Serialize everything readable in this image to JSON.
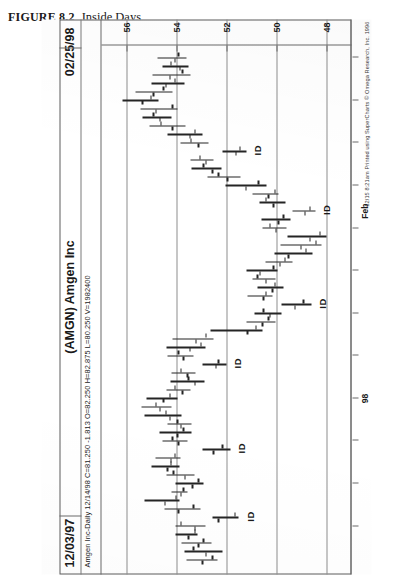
{
  "figure": {
    "number": "FIGURE 8.2",
    "title": "Inside Days"
  },
  "chart_header": {
    "date_left": "12/03/97",
    "symbol_title": "(AMGN) Amgen Inc",
    "date_right": "02/25/98",
    "quote_line": "Amgen Inc-Daily  12/14/98  C=81.250 -1.813  O=82.250  H=82.875  L=80.250  V=1982400"
  },
  "credit": "12/15 8:21am Printed using SuperCharts © Omega Research, Inc. 1996",
  "chart_data": {
    "type": "bar",
    "title": "(AMGN) Amgen Inc",
    "subtitle": "Amgen Inc-Daily  12/14/98  C=81.250 -1.813  O=82.250  H=82.875  L=80.250  V=1982400",
    "xlabel": "",
    "ylabel": "Price",
    "ylim": [
      47.0,
      57.0
    ],
    "yticks": [
      56,
      54,
      52,
      50,
      48
    ],
    "grid": true,
    "legend": null,
    "date_range": [
      "12/03/97",
      "02/25/98"
    ],
    "x_tick_labels": [
      {
        "label": "98",
        "index": 19
      },
      {
        "label": "Feb",
        "index": 41
      }
    ],
    "annotations": [
      {
        "text": "ID",
        "index": 5
      },
      {
        "text": "ID",
        "index": 13
      },
      {
        "text": "ID",
        "index": 23
      },
      {
        "text": "ID",
        "index": 30
      },
      {
        "text": "ID",
        "index": 41
      },
      {
        "text": "ID",
        "index": 48
      }
    ],
    "ohlc": [
      {
        "i": 0,
        "open": 53.0,
        "high": 53.6,
        "low": 52.35,
        "close": 52.6
      },
      {
        "i": 1,
        "open": 52.85,
        "high": 53.7,
        "low": 52.15,
        "close": 53.35
      },
      {
        "i": 2,
        "open": 53.15,
        "high": 53.8,
        "low": 52.6,
        "close": 52.95
      },
      {
        "i": 3,
        "open": 53.55,
        "high": 54.05,
        "low": 53.15,
        "close": 53.3
      },
      {
        "i": 4,
        "open": 53.3,
        "high": 54.05,
        "low": 52.85,
        "close": 53.85
      },
      {
        "i": 5,
        "open": 52.35,
        "high": 52.55,
        "low": 51.5,
        "close": 51.7
      },
      {
        "i": 6,
        "open": 53.95,
        "high": 54.5,
        "low": 53.05,
        "close": 53.35
      },
      {
        "i": 7,
        "open": 54.5,
        "high": 55.3,
        "low": 53.9,
        "close": 54.05
      },
      {
        "i": 8,
        "open": 53.85,
        "high": 54.2,
        "low": 53.55,
        "close": 53.75
      },
      {
        "i": 9,
        "open": 53.4,
        "high": 54.05,
        "low": 52.9,
        "close": 53.15
      },
      {
        "i": 10,
        "open": 53.7,
        "high": 54.4,
        "low": 53.3,
        "close": 54.15
      },
      {
        "i": 11,
        "open": 54.4,
        "high": 55.0,
        "low": 53.9,
        "close": 54.25
      },
      {
        "i": 12,
        "open": 54.25,
        "high": 54.85,
        "low": 53.85,
        "close": 54.1
      },
      {
        "i": 13,
        "open": 52.55,
        "high": 52.95,
        "low": 51.85,
        "close": 52.2
      },
      {
        "i": 14,
        "open": 53.95,
        "high": 54.55,
        "low": 53.55,
        "close": 54.2
      },
      {
        "i": 15,
        "open": 54.0,
        "high": 54.7,
        "low": 53.4,
        "close": 53.75
      },
      {
        "i": 16,
        "open": 53.85,
        "high": 54.35,
        "low": 53.4,
        "close": 54.0
      },
      {
        "i": 17,
        "open": 54.3,
        "high": 55.3,
        "low": 53.8,
        "close": 54.45
      },
      {
        "i": 18,
        "open": 54.7,
        "high": 55.4,
        "low": 54.2,
        "close": 54.85
      },
      {
        "i": 19,
        "open": 54.55,
        "high": 55.2,
        "low": 53.95,
        "close": 54.3
      },
      {
        "i": 20,
        "open": 53.8,
        "high": 54.4,
        "low": 53.45,
        "close": 54.1
      },
      {
        "i": 21,
        "open": 53.3,
        "high": 54.25,
        "low": 52.9,
        "close": 53.55
      },
      {
        "i": 22,
        "open": 53.6,
        "high": 54.2,
        "low": 53.25,
        "close": 53.85
      },
      {
        "i": 23,
        "open": 52.45,
        "high": 52.95,
        "low": 52.0,
        "close": 52.35
      },
      {
        "i": 24,
        "open": 53.75,
        "high": 54.35,
        "low": 53.3,
        "close": 53.95
      },
      {
        "i": 25,
        "open": 53.5,
        "high": 54.4,
        "low": 52.85,
        "close": 53.05
      },
      {
        "i": 26,
        "open": 53.25,
        "high": 54.15,
        "low": 52.5,
        "close": 52.85
      },
      {
        "i": 27,
        "open": 51.2,
        "high": 52.65,
        "low": 50.55,
        "close": 50.85
      },
      {
        "i": 28,
        "open": 50.6,
        "high": 51.2,
        "low": 50.05,
        "close": 50.35
      },
      {
        "i": 29,
        "open": 50.3,
        "high": 50.9,
        "low": 49.8,
        "close": 50.55
      },
      {
        "i": 30,
        "open": 49.3,
        "high": 49.8,
        "low": 48.6,
        "close": 48.95
      },
      {
        "i": 31,
        "open": 50.55,
        "high": 51.15,
        "low": 50.15,
        "close": 50.45
      },
      {
        "i": 32,
        "open": 50.2,
        "high": 50.75,
        "low": 49.7,
        "close": 50.1
      },
      {
        "i": 33,
        "open": 50.45,
        "high": 50.95,
        "low": 50.05,
        "close": 50.8
      },
      {
        "i": 34,
        "open": 50.7,
        "high": 51.2,
        "low": 49.95,
        "close": 50.15
      },
      {
        "i": 35,
        "open": 49.9,
        "high": 50.45,
        "low": 49.35,
        "close": 49.7
      },
      {
        "i": 36,
        "open": 49.55,
        "high": 50.1,
        "low": 48.55,
        "close": 48.85
      },
      {
        "i": 37,
        "open": 49.05,
        "high": 49.85,
        "low": 48.2,
        "close": 48.45
      },
      {
        "i": 38,
        "open": 48.7,
        "high": 49.55,
        "low": 48.0,
        "close": 48.3
      },
      {
        "i": 39,
        "open": 50.05,
        "high": 50.55,
        "low": 49.6,
        "close": 50.3
      },
      {
        "i": 40,
        "open": 49.95,
        "high": 50.6,
        "low": 49.45,
        "close": 49.75
      },
      {
        "i": 41,
        "open": 48.9,
        "high": 49.35,
        "low": 48.45,
        "close": 48.7
      },
      {
        "i": 42,
        "open": 50.15,
        "high": 50.7,
        "low": 49.65,
        "close": 50.45
      },
      {
        "i": 43,
        "open": 50.35,
        "high": 50.95,
        "low": 49.9,
        "close": 50.1
      },
      {
        "i": 44,
        "open": 51.25,
        "high": 52.05,
        "low": 50.4,
        "close": 50.75
      },
      {
        "i": 45,
        "open": 52.0,
        "high": 52.75,
        "low": 51.45,
        "close": 52.35
      },
      {
        "i": 46,
        "open": 52.6,
        "high": 53.4,
        "low": 52.2,
        "close": 52.95
      },
      {
        "i": 47,
        "open": 52.85,
        "high": 53.45,
        "low": 52.5,
        "close": 53.1
      },
      {
        "i": 48,
        "open": 51.65,
        "high": 52.15,
        "low": 51.2,
        "close": 51.5
      },
      {
        "i": 49,
        "open": 53.15,
        "high": 53.85,
        "low": 52.7,
        "close": 53.45
      },
      {
        "i": 50,
        "open": 53.5,
        "high": 54.35,
        "low": 52.95,
        "close": 53.3
      },
      {
        "i": 51,
        "open": 54.2,
        "high": 55.1,
        "low": 53.65,
        "close": 54.65
      },
      {
        "i": 52,
        "open": 54.7,
        "high": 55.35,
        "low": 54.2,
        "close": 54.95
      },
      {
        "i": 53,
        "open": 54.85,
        "high": 55.45,
        "low": 53.95,
        "close": 54.2
      },
      {
        "i": 54,
        "open": 55.4,
        "high": 56.15,
        "low": 54.7,
        "close": 55.05
      },
      {
        "i": 55,
        "open": 54.95,
        "high": 55.65,
        "low": 54.15,
        "close": 54.55
      },
      {
        "i": 56,
        "open": 54.45,
        "high": 55.0,
        "low": 53.7,
        "close": 54.1
      },
      {
        "i": 57,
        "open": 54.3,
        "high": 54.95,
        "low": 53.45,
        "close": 53.8
      },
      {
        "i": 58,
        "open": 53.9,
        "high": 54.55,
        "low": 53.5,
        "close": 54.25
      },
      {
        "i": 59,
        "open": 54.1,
        "high": 54.75,
        "low": 53.6,
        "close": 53.95
      }
    ]
  }
}
